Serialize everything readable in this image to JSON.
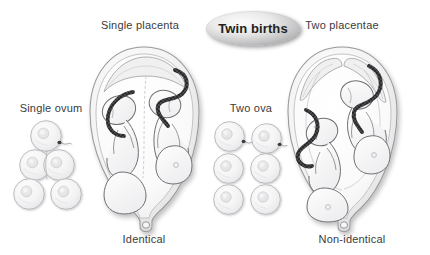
{
  "figure": {
    "title": "Twin births",
    "background_color": "#ffffff",
    "ink_color": "#5a5a5e",
    "label_color": "#3b3b3d",
    "title_color": "#231f20",
    "badge": {
      "shape": "ellipse",
      "fill_light": "#f2f2f2",
      "fill_dark": "#9d9d9f",
      "shadow_color": "#d7d7d8"
    },
    "labels": {
      "single_placenta": "Single placenta",
      "two_placentae": "Two placentae",
      "single_ovum": "Single ovum",
      "two_ova": "Two ova",
      "identical": "Identical",
      "non_identical": "Non-identical"
    },
    "panels": [
      {
        "name": "identical-twins",
        "top_label": "Single placenta",
        "side_label": "Single ovum",
        "bottom_label": "Identical",
        "ovum_count": 1,
        "sperm_count": 1,
        "placenta_count": 1,
        "fetus_count": 2,
        "stages": [
          "single fertilised ovum",
          "ovum divides into two cells",
          "two identical cells separate"
        ]
      },
      {
        "name": "non-identical-twins",
        "top_label": "Two placentae",
        "side_label": "Two ova",
        "bottom_label": "Non-identical",
        "ovum_count": 2,
        "sperm_count": 2,
        "placenta_count": 2,
        "fetus_count": 2,
        "stages": [
          "two ova each fertilised by a sperm",
          "two separate cells develop",
          "two non-identical cells"
        ]
      }
    ]
  }
}
